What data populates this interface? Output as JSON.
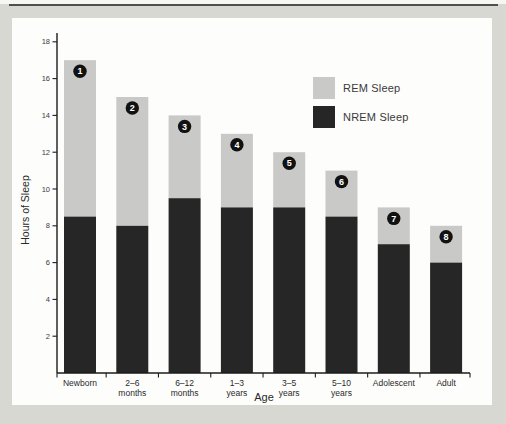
{
  "page": {
    "background_color": "#d8d8d2",
    "panel_color": "#fdfdfb",
    "top_rule_color": "#4f4f4f"
  },
  "chart_data": {
    "type": "bar",
    "stacked": true,
    "title": "",
    "xlabel": "Age",
    "ylabel": "Hours of Sleep",
    "ylim": [
      0,
      18.5
    ],
    "yticks": [
      2,
      4,
      6,
      8,
      10,
      12,
      14,
      16,
      18
    ],
    "grid": false,
    "categories": [
      [
        "Newborn"
      ],
      [
        "2–6",
        "months"
      ],
      [
        "6–12",
        "months"
      ],
      [
        "1–3",
        "years"
      ],
      [
        "3–5",
        "years"
      ],
      [
        "5–10",
        "years"
      ],
      [
        "Adolescent"
      ],
      [
        "Adult"
      ]
    ],
    "series": [
      {
        "name": "NREM Sleep",
        "color": "#262626",
        "values": [
          8.5,
          8,
          9.5,
          9,
          9,
          8.5,
          7,
          6
        ]
      },
      {
        "name": "REM Sleep",
        "color": "#c9c9c7",
        "values": [
          8.5,
          7,
          4.5,
          4,
          3,
          2.5,
          2,
          2
        ]
      }
    ],
    "totals": [
      17,
      15,
      14,
      13,
      12,
      11,
      9,
      8
    ],
    "badges": [
      "1",
      "2",
      "3",
      "4",
      "5",
      "6",
      "7",
      "8"
    ],
    "badge_fill": "#111111",
    "badge_text_color": "#ffffff",
    "axis_color": "#1c1c1c",
    "tick_label_color": "#3c3c3c",
    "category_label_color": "#2a2a2a",
    "legend": {
      "position": "upper-right",
      "entries": [
        {
          "label": "REM Sleep",
          "color": "#c9c9c7"
        },
        {
          "label": "NREM Sleep",
          "color": "#262626"
        }
      ]
    }
  }
}
